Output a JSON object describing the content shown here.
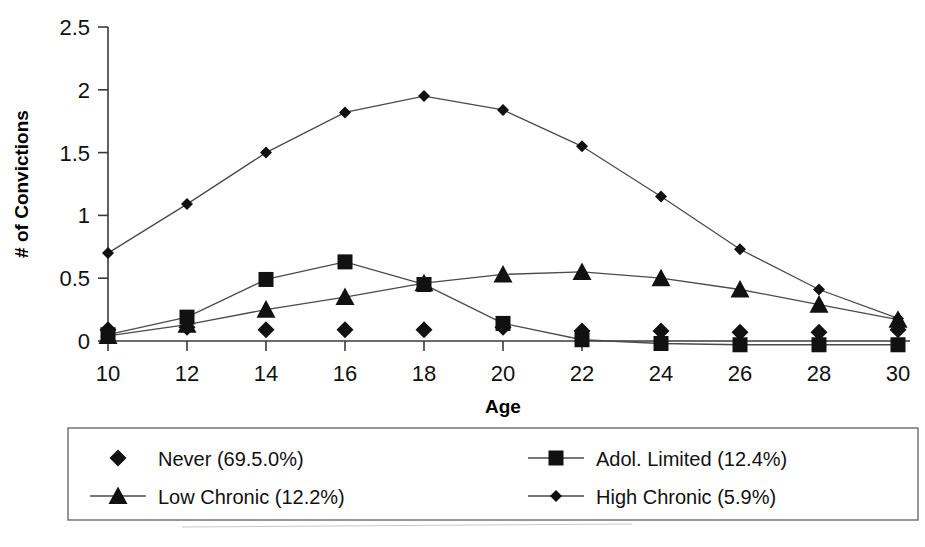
{
  "chart_data": {
    "type": "line",
    "title": "",
    "xlabel": "Age",
    "ylabel": "# of Convictions",
    "x": [
      10,
      12,
      14,
      16,
      18,
      20,
      22,
      24,
      26,
      28,
      30
    ],
    "categories": [
      "10",
      "12",
      "14",
      "16",
      "18",
      "20",
      "22",
      "24",
      "26",
      "28",
      "30"
    ],
    "xlim": [
      10,
      30
    ],
    "ylim": [
      0,
      2.5
    ],
    "yticks": [
      0,
      0.5,
      1,
      1.5,
      2,
      2.5
    ],
    "ytick_labels": [
      "0",
      "0.5",
      "1",
      "1.5",
      "2",
      "2.5"
    ],
    "grid": false,
    "legend_position": "below-plot",
    "series": [
      {
        "name": "Never (69.5.0%)",
        "marker": "diamond",
        "line": false,
        "values": [
          0.09,
          0.11,
          0.09,
          0.09,
          0.09,
          0.11,
          0.08,
          0.08,
          0.07,
          0.07,
          0.09
        ]
      },
      {
        "name": "Adol. Limited (12.4%)",
        "marker": "square",
        "line": true,
        "values": [
          0.05,
          0.19,
          0.49,
          0.63,
          0.45,
          0.14,
          0.01,
          -0.02,
          -0.03,
          -0.03,
          -0.03
        ]
      },
      {
        "name": "Low Chronic (12.2%)",
        "marker": "triangle",
        "line": true,
        "values": [
          0.04,
          0.13,
          0.25,
          0.35,
          0.46,
          0.53,
          0.55,
          0.5,
          0.41,
          0.29,
          0.17
        ]
      },
      {
        "name": "High Chronic (5.9%)",
        "marker": "smalldiamond",
        "line": true,
        "values": [
          0.7,
          1.09,
          1.5,
          1.82,
          1.95,
          1.84,
          1.55,
          1.15,
          0.73,
          0.41,
          0.18
        ]
      }
    ]
  },
  "legend": {
    "entries": [
      {
        "label": "Never (69.5.0%)",
        "marker": "diamond",
        "has_line": false
      },
      {
        "label": "Adol. Limited (12.4%)",
        "marker": "square",
        "has_line": true
      },
      {
        "label": "Low Chronic (12.2%)",
        "marker": "triangle",
        "has_line": true
      },
      {
        "label": "High Chronic (5.9%)",
        "marker": "smalldiamond",
        "has_line": true
      }
    ]
  },
  "colors": {
    "marker": "#111111",
    "line": "#4a4a4a",
    "axis": "#3a3a3a",
    "legend_border": "#6b6b6b",
    "background": "#ffffff"
  }
}
